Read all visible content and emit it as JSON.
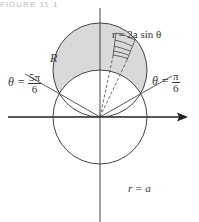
{
  "header": {
    "text": "FIGURE 11.1"
  },
  "diagram": {
    "labels": {
      "upper_curve": "r = 2a sin θ",
      "lower_curve": "r = a",
      "region": "R",
      "left_ray_lhs": "θ =",
      "left_ray_num": "5π",
      "left_ray_den": "6",
      "right_ray_lhs": "θ =",
      "right_ray_num": "π",
      "right_ray_den": "6"
    },
    "colors": {
      "shade": "#d9d9d9",
      "stroke": "#444444"
    },
    "geometry": {
      "origin": [
        100,
        117
      ],
      "a_px": 47
    }
  }
}
